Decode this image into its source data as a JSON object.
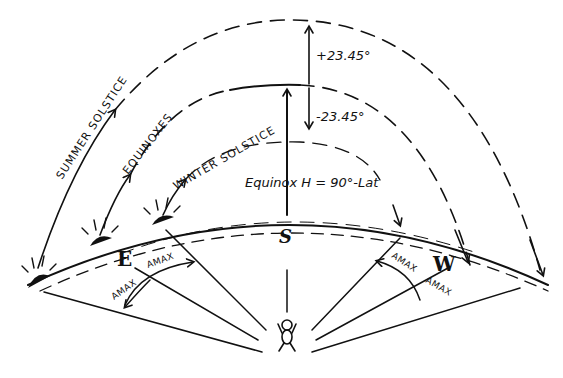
{
  "diagram": {
    "paths": {
      "summer": {
        "label": "SUMMER SOLSTICE"
      },
      "equinox": {
        "label": "EQUINOXES"
      },
      "winter": {
        "label": "WINTER SOLSTICE"
      }
    },
    "angles": {
      "plus": "+23.45°",
      "minus": "-23.45°",
      "equinox_height": "Equinox H = 90°-Lat"
    },
    "directions": {
      "east": "E",
      "south": "S",
      "west": "W"
    },
    "azimuth_labels": {
      "east_upper": "AMAX",
      "east_lower": "AMAX",
      "west_upper": "AMAX",
      "west_lower": "AMAX"
    },
    "observer": {
      "icon": "person-icon"
    },
    "sun_icons": [
      "sunrise-summer-icon",
      "sunrise-equinox-icon",
      "sunrise-winter-icon"
    ],
    "colors": {
      "ink": "#111111",
      "paper": "#ffffff"
    }
  }
}
